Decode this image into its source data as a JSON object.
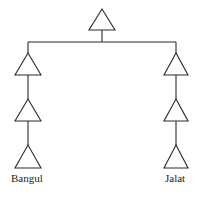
{
  "diagram": {
    "type": "kinship-tree",
    "symbol": "triangle",
    "root": {
      "symbol": "triangle",
      "label": ""
    },
    "branches": [
      {
        "name": "left",
        "generations": 3,
        "label": "Bangul"
      },
      {
        "name": "right",
        "generations": 3,
        "label": "Jalat"
      }
    ]
  },
  "labels": {
    "left": "Bangul",
    "right": "Jalat"
  }
}
